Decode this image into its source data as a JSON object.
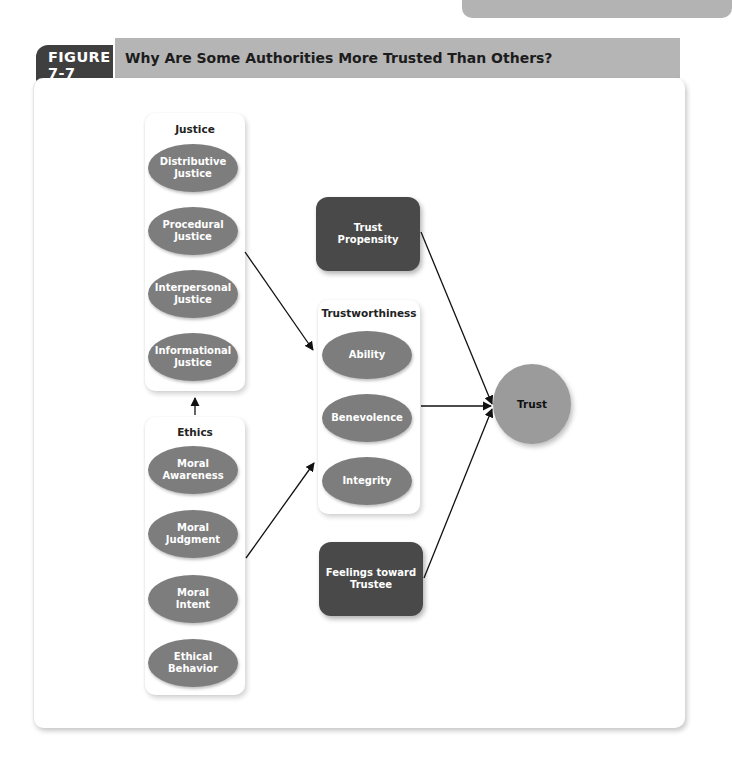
{
  "figure": {
    "label": "FIGURE 7-7",
    "title": "Why Are Some Authorities More Trusted Than Others?"
  },
  "justice": {
    "title": "Justice",
    "items": [
      {
        "line1": "Distributive",
        "line2": "Justice"
      },
      {
        "line1": "Procedural",
        "line2": "Justice"
      },
      {
        "line1": "Interpersonal",
        "line2": "Justice"
      },
      {
        "line1": "Informational",
        "line2": "Justice"
      }
    ]
  },
  "ethics": {
    "title": "Ethics",
    "items": [
      {
        "line1": "Moral",
        "line2": "Awareness"
      },
      {
        "line1": "Moral",
        "line2": "Judgment"
      },
      {
        "line1": "Moral",
        "line2": "Intent"
      },
      {
        "line1": "Ethical",
        "line2": "Behavior"
      }
    ]
  },
  "trustworthiness": {
    "title": "Trustworthiness",
    "items": [
      "Ability",
      "Benevolence",
      "Integrity"
    ]
  },
  "trust_propensity": {
    "line1": "Trust",
    "line2": "Propensity"
  },
  "feelings": {
    "line1": "Feelings toward",
    "line2": "Trustee"
  },
  "trust": {
    "label": "Trust"
  },
  "edges": [
    {
      "from": "Ethics",
      "to": "Justice"
    },
    {
      "from": "Justice",
      "to": "Trustworthiness"
    },
    {
      "from": "Ethics",
      "to": "Trustworthiness"
    },
    {
      "from": "Trust Propensity",
      "to": "Trust"
    },
    {
      "from": "Trustworthiness",
      "to": "Trust"
    },
    {
      "from": "Feelings toward Trustee",
      "to": "Trust"
    }
  ],
  "colors": {
    "ellipse": "#7d7d7d",
    "dark_box": "#494949",
    "trust_circle": "#9b9b9b",
    "title_bar": "#b5b5b5",
    "figure_label": "#3f3f3f"
  }
}
